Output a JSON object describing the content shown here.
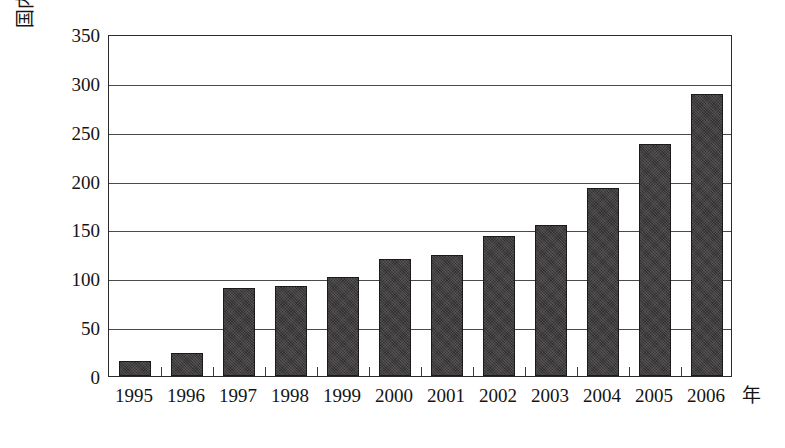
{
  "chart_data": {
    "type": "bar",
    "title": "",
    "xlabel": "年",
    "ylabel": "国内旅游收入(亿元)",
    "categories": [
      "1995",
      "1996",
      "1997",
      "1998",
      "1999",
      "2000",
      "2001",
      "2002",
      "2003",
      "2004",
      "2005",
      "2006"
    ],
    "values": [
      15,
      24,
      90,
      92,
      101,
      120,
      124,
      143,
      155,
      192,
      237,
      289
    ],
    "ylim": [
      0,
      350
    ],
    "y_ticks": [
      0,
      50,
      100,
      150,
      200,
      250,
      300,
      350
    ],
    "y_tick_labels": [
      "0",
      "50",
      "100",
      "150",
      "200",
      "250",
      "300",
      "350"
    ],
    "grid": true,
    "grid_axis": "y",
    "legend": false,
    "legend_position": "none",
    "series_color": "#333031",
    "axis_color": "#2b2b2b",
    "background": "#ffffff"
  },
  "axes": {
    "y_title": "国内旅游收入(亿元)",
    "x_unit": "年"
  }
}
